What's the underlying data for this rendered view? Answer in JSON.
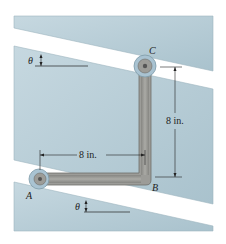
{
  "figure": {
    "points": {
      "A": "A",
      "B": "B",
      "C": "C"
    },
    "dimensions": {
      "horizontal": "8 in.",
      "vertical": "8 in."
    },
    "angle_labels": {
      "upper": "θ",
      "lower": "θ"
    },
    "colors": {
      "slab_fill": "#b9d0da",
      "slab_edge": "#8fa9b5",
      "rod_fill": "#9c9c98",
      "rod_edge": "#6f6f6b",
      "collar_fill": "#a9c3d2",
      "dimension_line": "#222222"
    }
  }
}
